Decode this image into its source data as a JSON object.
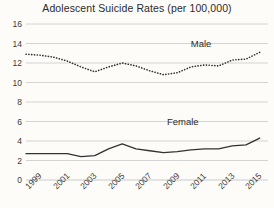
{
  "chart_data": {
    "type": "line",
    "title": "Adolescent Suicide Rates (per 100,000)",
    "xlabel": "",
    "ylabel": "",
    "xlim": [
      1999,
      2016.6
    ],
    "ylim": [
      0,
      16
    ],
    "yticks": [
      0,
      2,
      4,
      6,
      8,
      10,
      12,
      14,
      16
    ],
    "xticks": [
      1999,
      2001,
      2003,
      2005,
      2007,
      2009,
      2011,
      2013,
      2015
    ],
    "xtick_labels": [
      "1999",
      "2001",
      "2003",
      "2005",
      "2007",
      "2009",
      "2011",
      "2013",
      "2015"
    ],
    "grid": "horizontal",
    "legend_position": "inline-labels",
    "x": [
      1999,
      2000,
      2001,
      2002,
      2003,
      2004,
      2005,
      2006,
      2007,
      2008,
      2009,
      2010,
      2011,
      2012,
      2013,
      2014,
      2015,
      2016
    ],
    "series": [
      {
        "name": "Male",
        "label": "Male",
        "style": "dotted",
        "color": "#333333",
        "values": [
          12.9,
          12.8,
          12.6,
          12.2,
          11.6,
          11.1,
          11.6,
          12.0,
          11.7,
          11.2,
          10.8,
          11.0,
          11.6,
          11.8,
          11.7,
          12.3,
          12.4,
          13.1
        ]
      },
      {
        "name": "Female",
        "label": "Female",
        "style": "solid",
        "color": "#333333",
        "values": [
          2.7,
          2.7,
          2.7,
          2.7,
          2.4,
          2.5,
          3.2,
          3.7,
          3.2,
          3.0,
          2.8,
          2.9,
          3.1,
          3.2,
          3.2,
          3.5,
          3.6,
          4.3
        ]
      }
    ],
    "annotations": [
      {
        "text": "Male",
        "x": 2012.0,
        "y": 13.9
      },
      {
        "text": "Female",
        "x": 2010.7,
        "y": 5.9
      }
    ],
    "colors": {
      "background": "#fdfcf8",
      "grid": "#c9c9c9",
      "axis": "#8d8d8d",
      "text": "#2b2b2b",
      "line": "#333333"
    }
  }
}
